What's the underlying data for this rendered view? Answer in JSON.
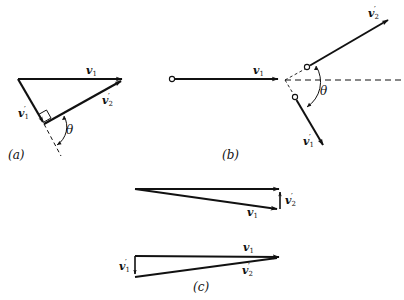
{
  "figure": {
    "panels": [
      {
        "id": "a",
        "caption": "(a)",
        "labels": {
          "v1": {
            "base": "v",
            "sub": "1",
            "prime": ""
          },
          "v1p": {
            "base": "v",
            "sub": "1",
            "prime": "′"
          },
          "v2p": {
            "base": "v",
            "sub": "2",
            "prime": "′"
          },
          "theta": "θ"
        }
      },
      {
        "id": "b",
        "caption": "(b)",
        "labels": {
          "v1": {
            "base": "v",
            "sub": "1",
            "prime": ""
          },
          "v1p": {
            "base": "v",
            "sub": "1",
            "prime": "′"
          },
          "v2p": {
            "base": "v",
            "sub": "2",
            "prime": "′"
          },
          "theta": "θ"
        }
      },
      {
        "id": "c",
        "caption": "(c)",
        "upper": {
          "v1p": {
            "base": "v",
            "sub": "1",
            "prime": "′"
          },
          "v2p": {
            "base": "v",
            "sub": "2",
            "prime": "′"
          }
        },
        "lower": {
          "v1": {
            "base": "v",
            "sub": "1",
            "prime": ""
          },
          "v1p": {
            "base": "v",
            "sub": "1",
            "prime": "′"
          },
          "v2p": {
            "base": "v",
            "sub": "2",
            "prime": "′"
          }
        }
      }
    ],
    "colors": {
      "stroke": "#111111",
      "background": "#ffffff"
    }
  }
}
